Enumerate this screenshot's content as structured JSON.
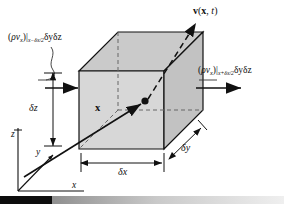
{
  "figure": {
    "type": "control-volume-diagram",
    "colors": {
      "face_fill": "#d4d4d4",
      "top_fill": "#cacaca",
      "side_fill": "#bdbdbd",
      "line": "#111111",
      "dashed": "#555555",
      "bar_dark": "#0d0d0d"
    }
  },
  "labels": {
    "flux_in": {
      "prefix_open": "(",
      "rho": "ρ",
      "v": "v",
      "v_sub": "x",
      "prefix_close": ")",
      "bar": "|",
      "eval_sub": "x−δx/2",
      "area": "δyδz",
      "full_text": "(ρvₓ)|ₓ₋δₓ/₂ δyδz"
    },
    "flux_out": {
      "prefix_open": "(",
      "rho": "ρ",
      "v": "v",
      "v_sub": "x",
      "prefix_close": ")",
      "bar": "|",
      "eval_sub": "x+δx/2",
      "area": "δyδz",
      "full_text": "(ρvₓ)|ₓ₊δₓ/₂ δyδz"
    },
    "velocity": "v(x, t)",
    "velocity_symbol": "v",
    "velocity_args_open": "(",
    "velocity_arg_x": "x",
    "velocity_comma": ", ",
    "velocity_arg_t": "t",
    "velocity_args_close": ")",
    "position_vector": "x",
    "delta_z": "δz",
    "delta_x": "δx",
    "delta_y": "δy",
    "axis_z": "z",
    "axis_y": "y",
    "axis_x": "x"
  }
}
